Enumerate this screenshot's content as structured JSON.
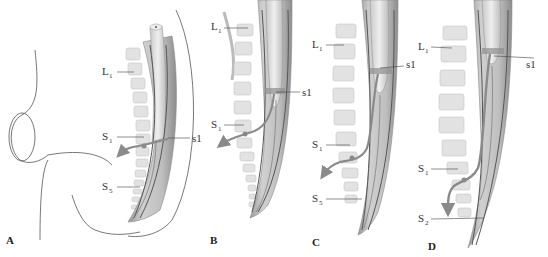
{
  "figure": {
    "panels": [
      {
        "id": "A",
        "letter": "A",
        "labels": {
          "l1": {
            "main": "L",
            "sub": "1"
          },
          "s1": {
            "main": "S",
            "sub": "1"
          },
          "s5": {
            "main": "S",
            "sub": "5"
          },
          "cord": "s1"
        }
      },
      {
        "id": "B",
        "letter": "B",
        "labels": {
          "l1": {
            "main": "L",
            "sub": "1"
          },
          "s1": {
            "main": "S",
            "sub": "1"
          },
          "cord": "s1"
        }
      },
      {
        "id": "C",
        "letter": "C",
        "labels": {
          "l1": {
            "main": "L",
            "sub": "1"
          },
          "s1": {
            "main": "S",
            "sub": "1"
          },
          "s5": {
            "main": "S",
            "sub": "5"
          },
          "cord": "s1"
        }
      },
      {
        "id": "D",
        "letter": "D",
        "labels": {
          "l1": {
            "main": "L",
            "sub": "1"
          },
          "s1": {
            "main": "S",
            "sub": "1"
          },
          "s2": {
            "main": "S",
            "sub": "2"
          },
          "cord": "s1"
        }
      }
    ],
    "colors": {
      "vertebra": "#e2e2e2",
      "vertebra_stroke": "#c8c8c8",
      "dura": "#bdbdbd",
      "cord": "#d6d6d6",
      "dark_line": "#555555",
      "arrow": "#8a8a8a",
      "outline": "#444444"
    }
  }
}
